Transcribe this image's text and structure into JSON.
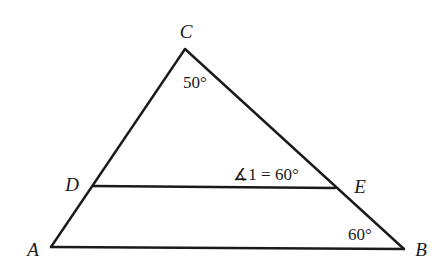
{
  "diagram": {
    "type": "triangle-with-parallel-segment",
    "stroke_color": "#1a1a1a",
    "background": "#ffffff",
    "points": {
      "C": {
        "label": "C",
        "x": 185,
        "y": 49,
        "label_x": 186,
        "label_y": 38
      },
      "A": {
        "label": "A",
        "x": 51,
        "y": 247,
        "label_x": 33,
        "label_y": 256
      },
      "B": {
        "label": "B",
        "x": 404,
        "y": 249,
        "label_x": 421,
        "label_y": 256
      },
      "D": {
        "label": "D",
        "x": 93,
        "y": 186,
        "label_x": 72,
        "label_y": 191
      },
      "E": {
        "label": "E",
        "x": 335,
        "y": 188,
        "label_x": 360,
        "label_y": 193
      }
    },
    "segments": [
      "AC",
      "CB",
      "AB",
      "DE"
    ],
    "angles": {
      "C": {
        "text": "50°",
        "x": 195,
        "y": 88
      },
      "angle1": {
        "text": "∡1 = 60°",
        "x": 266,
        "y": 180
      },
      "B": {
        "text": "60°",
        "x": 360,
        "y": 240
      }
    }
  }
}
